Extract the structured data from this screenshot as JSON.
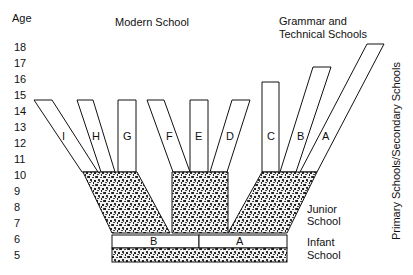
{
  "diagram": {
    "axis_title": "Age",
    "ages": [
      "18",
      "17",
      "16",
      "15",
      "14",
      "13",
      "12",
      "11",
      "10",
      "9",
      "8",
      "7",
      "6",
      "5"
    ],
    "headers": {
      "modern": "Modern School",
      "grammar_line1": "Grammar and",
      "grammar_line2": "Technical Schools"
    },
    "side_labels": {
      "junior_line1": "Junior",
      "junior_line2": "School",
      "infant_line1": "Infant",
      "infant_line2": "School",
      "vertical": "Primary Schools/Secondary Schools"
    },
    "secondary_branches": [
      "I",
      "H",
      "G",
      "F",
      "E",
      "D",
      "C",
      "B",
      "A"
    ],
    "infant_sections": [
      "B",
      "A"
    ],
    "colors": {
      "line": "#111111",
      "fill": "#ffffff",
      "texture": "#333333"
    }
  }
}
